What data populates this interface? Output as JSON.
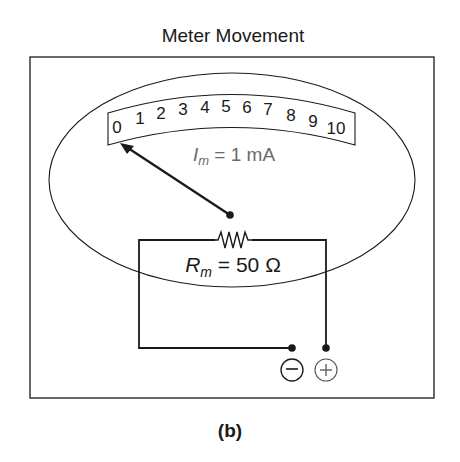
{
  "title": "Meter Movement",
  "caption": "(b)",
  "scale": {
    "labels": [
      "0",
      "1",
      "2",
      "3",
      "4",
      "5",
      "6",
      "7",
      "8",
      "9",
      "10"
    ]
  },
  "current_label": {
    "symbol": "I",
    "subscript": "m",
    "value": " = 1 mA"
  },
  "resistance_label": {
    "symbol": "R",
    "subscript": "m",
    "value": " = 50 Ω"
  },
  "terminals": {
    "negative": "−",
    "positive": "+"
  },
  "colors": {
    "line": "#1a1a1a",
    "current_text": "#6a6a6a"
  }
}
